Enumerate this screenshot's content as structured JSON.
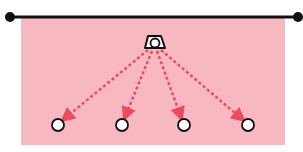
{
  "diagram": {
    "type": "drill-layout",
    "colors": {
      "field": "#f7b8c2",
      "line": "#111111",
      "arrow": "#ee4a5e",
      "cone_fill": "#ffffff",
      "cone_stroke": "#111111",
      "player_fill": "#ffffff",
      "player_stroke": "#111111"
    },
    "boundary_line": {
      "x1": 10,
      "y1": 17,
      "x2": 298,
      "y2": 17
    },
    "field": {
      "x": 21,
      "y": 18,
      "width": 264,
      "height": 127
    },
    "origin": {
      "icon": "cone-with-ball-icon",
      "x": 154,
      "y": 41
    },
    "targets": [
      {
        "x": 58,
        "y": 125
      },
      {
        "x": 122,
        "y": 125
      },
      {
        "x": 184,
        "y": 125
      },
      {
        "x": 248,
        "y": 125
      }
    ]
  }
}
